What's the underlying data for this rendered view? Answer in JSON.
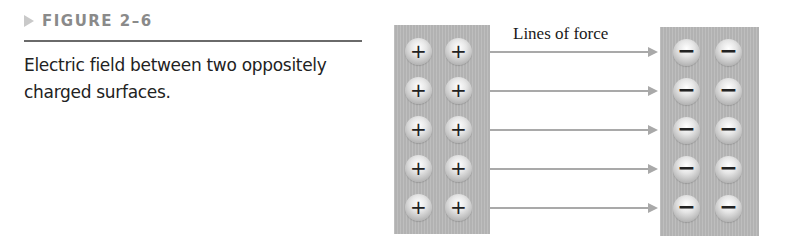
{
  "figure": {
    "label": "FIGURE 2–6",
    "caption": "Electric field between two oppositely charged surfaces."
  },
  "diagram": {
    "annotation": "Lines of force",
    "positive_surface": {
      "symbol": "+",
      "rows": 5,
      "columns": 2
    },
    "negative_surface": {
      "symbol": "−",
      "rows": 5,
      "columns": 2
    },
    "field_lines": 5,
    "colors": {
      "surface": "#b9b9b9",
      "arrow": "#a9a9a9",
      "rule": "#6a6a6a",
      "label": "#8a8a8a"
    }
  }
}
